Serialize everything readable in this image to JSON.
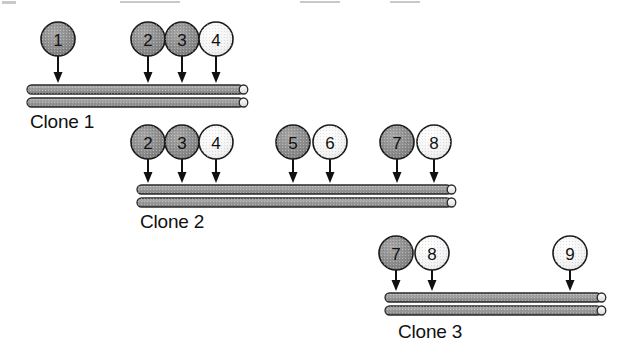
{
  "figure": {
    "background_color": "#ffffff",
    "width": 622,
    "height": 357
  },
  "palette": {
    "marker_dark": "#8d8d8d",
    "marker_light": "#f0f0f0",
    "marker_outline": "#1a1a1a",
    "bar_fill": "#9e9e9e",
    "bar_outline": "#2a2a2a",
    "bar_cap": "#e8e8e8",
    "text": "#111111",
    "arrow": "#111111"
  },
  "clones": [
    {
      "id": "clone-1",
      "label": "Clone 1",
      "label_x": 30,
      "label_y": 128,
      "bar": {
        "x": 27,
        "y": 85,
        "width": 222,
        "height": 9,
        "gap": 13
      },
      "markers": [
        {
          "number": "1",
          "shade": "dark",
          "cx": 58,
          "cy": 39,
          "r": 17,
          "arrow_to_y": 83
        },
        {
          "number": "2",
          "shade": "dark",
          "cx": 148,
          "cy": 39,
          "r": 17,
          "arrow_to_y": 83
        },
        {
          "number": "3",
          "shade": "dark",
          "cx": 182,
          "cy": 39,
          "r": 17,
          "arrow_to_y": 83
        },
        {
          "number": "4",
          "shade": "light",
          "cx": 216,
          "cy": 39,
          "r": 17,
          "arrow_to_y": 83
        }
      ]
    },
    {
      "id": "clone-2",
      "label": "Clone 2",
      "label_x": 140,
      "label_y": 228,
      "bar": {
        "x": 137,
        "y": 185,
        "width": 320,
        "height": 9,
        "gap": 13
      },
      "markers": [
        {
          "number": "2",
          "shade": "dark",
          "cx": 148,
          "cy": 142,
          "r": 17,
          "arrow_to_y": 183
        },
        {
          "number": "3",
          "shade": "dark",
          "cx": 182,
          "cy": 142,
          "r": 17,
          "arrow_to_y": 183
        },
        {
          "number": "4",
          "shade": "light",
          "cx": 216,
          "cy": 142,
          "r": 17,
          "arrow_to_y": 183
        },
        {
          "number": "5",
          "shade": "dark",
          "cx": 293,
          "cy": 142,
          "r": 17,
          "arrow_to_y": 183
        },
        {
          "number": "6",
          "shade": "light",
          "cx": 330,
          "cy": 142,
          "r": 17,
          "arrow_to_y": 183
        },
        {
          "number": "7",
          "shade": "dark",
          "cx": 397,
          "cy": 142,
          "r": 17,
          "arrow_to_y": 183
        },
        {
          "number": "8",
          "shade": "light",
          "cx": 434,
          "cy": 142,
          "r": 17,
          "arrow_to_y": 183
        }
      ]
    },
    {
      "id": "clone-3",
      "label": "Clone 3",
      "label_x": 398,
      "label_y": 338,
      "bar": {
        "x": 385,
        "y": 293,
        "width": 222,
        "height": 9,
        "gap": 13
      },
      "markers": [
        {
          "number": "7",
          "shade": "dark",
          "cx": 396,
          "cy": 253,
          "r": 17,
          "arrow_to_y": 291
        },
        {
          "number": "8",
          "shade": "light",
          "cx": 432,
          "cy": 253,
          "r": 17,
          "arrow_to_y": 291
        },
        {
          "number": "9",
          "shade": "light",
          "cx": 570,
          "cy": 253,
          "r": 17,
          "arrow_to_y": 291
        }
      ]
    }
  ],
  "top_specks": [
    {
      "x": 2,
      "y": 1,
      "w": 14,
      "h": 3
    },
    {
      "x": 120,
      "y": 1,
      "w": 60,
      "h": 2
    },
    {
      "x": 300,
      "y": 1,
      "w": 40,
      "h": 2
    },
    {
      "x": 390,
      "y": 1,
      "w": 30,
      "h": 2
    }
  ]
}
